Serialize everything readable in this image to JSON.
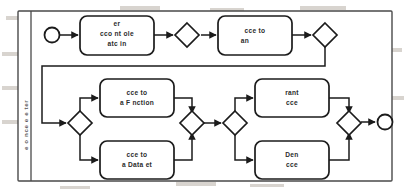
{
  "diagram": {
    "type": "bpmn-process-flow",
    "title": "",
    "pool": {
      "lane_label": "e o nce e  e ter",
      "border_color": "#4a4a4a",
      "background": "#ffffff"
    },
    "style": {
      "shape_stroke": "#1b1b1b",
      "shape_fill": "#ffffff",
      "text_color": "#2b2b2b",
      "connector_color": "#1b1b1b"
    },
    "events": [
      {
        "id": "start",
        "name": "start-event",
        "label": "",
        "cx": 52,
        "cy": 35,
        "r": 7.5
      },
      {
        "id": "end",
        "name": "end-event",
        "label": "",
        "cx": 385,
        "cy": 122,
        "r": 7.5
      }
    ],
    "tasks": [
      {
        "id": "task-user-account-role-matching",
        "name": "task-user-account-role-matching",
        "lines": [
          "er",
          "cco  nt  ole",
          "atc  in"
        ],
        "x": 80,
        "y": 16,
        "w": 74,
        "h": 39
      },
      {
        "id": "task-access-to-an",
        "name": "task-access-to-an",
        "lines": [
          "cce     to",
          "an"
        ],
        "x": 218,
        "y": 16,
        "w": 74,
        "h": 39
      },
      {
        "id": "task-access-to-a-function",
        "name": "task-access-to-a-function",
        "lines": [
          "cce     to",
          "a F  nction"
        ],
        "x": 100,
        "y": 79,
        "w": 74,
        "h": 38
      },
      {
        "id": "task-access-to-a-dataset",
        "name": "task-access-to-a-dataset",
        "lines": [
          "cce     to",
          "a Data   et"
        ],
        "x": 100,
        "y": 141,
        "w": 74,
        "h": 38
      },
      {
        "id": "task-grant-access",
        "name": "task-grant-access",
        "lines": [
          "rant",
          "cce"
        ],
        "x": 255,
        "y": 79,
        "w": 74,
        "h": 38
      },
      {
        "id": "task-deny-access",
        "name": "task-deny-access",
        "lines": [
          "Den",
          "cce"
        ],
        "x": 255,
        "y": 141,
        "w": 74,
        "h": 38
      }
    ],
    "gateways": [
      {
        "id": "gw-1",
        "name": "gateway-after-matching",
        "label": "",
        "cx": 187,
        "cy": 35,
        "r": 12
      },
      {
        "id": "gw-2",
        "name": "gateway-after-access-to-an",
        "label": "",
        "cx": 325,
        "cy": 35,
        "r": 12
      },
      {
        "id": "gw-3",
        "name": "gateway-split-resource-type",
        "label": "",
        "cx": 80,
        "cy": 123,
        "r": 12
      },
      {
        "id": "gw-4",
        "name": "gateway-merge-resource-type",
        "label": "",
        "cx": 192,
        "cy": 123,
        "r": 12
      },
      {
        "id": "gw-5",
        "name": "gateway-split-decision",
        "label": "",
        "cx": 235,
        "cy": 123,
        "r": 12
      },
      {
        "id": "gw-6",
        "name": "gateway-merge-decision",
        "label": "",
        "cx": 349,
        "cy": 123,
        "r": 12
      }
    ],
    "connectors": [
      {
        "name": "flow-start-to-matching",
        "points": "59.5,35 78,35"
      },
      {
        "name": "flow-matching-to-gw1",
        "points": "154,35 173,35"
      },
      {
        "name": "flow-gw1-to-access-to-an",
        "points": "201,35 216,35"
      },
      {
        "name": "flow-access-to-an-to-gw2",
        "points": "292,35 311,35"
      },
      {
        "name": "flow-gw2-to-gw3",
        "points": "325,47 325,66 42,66 42,123 66,123"
      },
      {
        "name": "flow-gw3-to-function",
        "points": "80,111 80,98 98,98"
      },
      {
        "name": "flow-gw3-to-dataset",
        "points": "80,135 80,160 98,160"
      },
      {
        "name": "flow-function-to-gw4",
        "points": "174,98 192,98 192,111"
      },
      {
        "name": "flow-dataset-to-gw4",
        "points": "174,160 192,160 192,135"
      },
      {
        "name": "flow-gw4-to-gw5",
        "points": "204,123 223,123"
      },
      {
        "name": "flow-gw5-to-grant",
        "points": "235,111 235,98 253,98"
      },
      {
        "name": "flow-gw5-to-deny",
        "points": "235,135 235,160 253,160"
      },
      {
        "name": "flow-grant-to-gw6",
        "points": "329,98 349,98 349,111"
      },
      {
        "name": "flow-deny-to-gw6",
        "points": "329,160 349,160 349,135"
      },
      {
        "name": "flow-gw6-to-end",
        "points": "361,122 377,122"
      }
    ]
  }
}
